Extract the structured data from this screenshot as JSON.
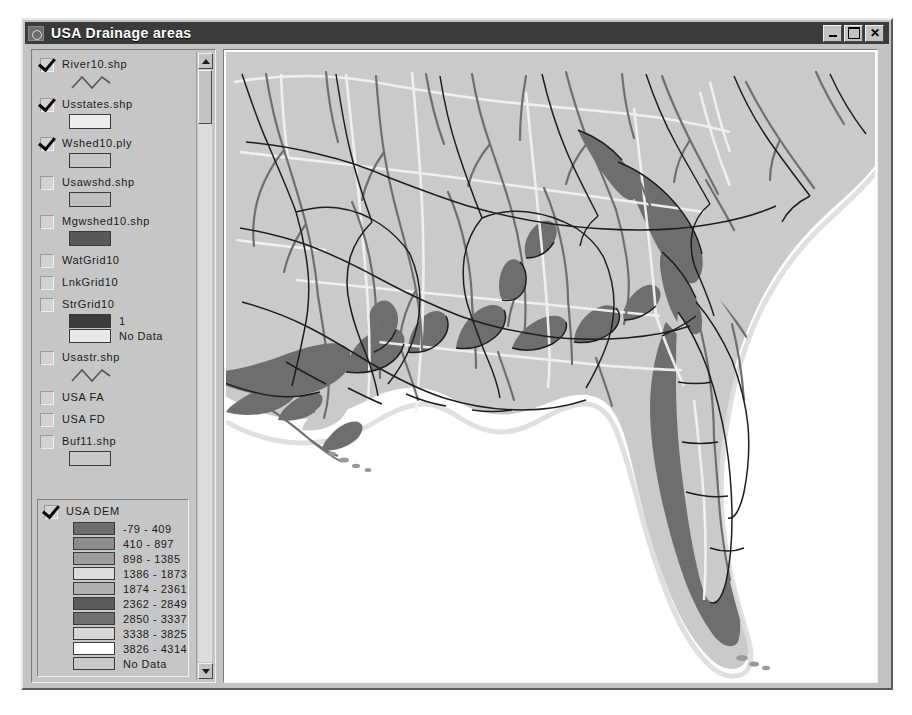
{
  "window": {
    "title": "USA Drainage areas",
    "icon": "app-icon",
    "buttons": {
      "minimize": "_",
      "maximize": "□",
      "close": "✕"
    }
  },
  "toc": {
    "layers": [
      {
        "name": "River10.shp",
        "checked": true,
        "symbol": "line"
      },
      {
        "name": "Usstates.shp",
        "checked": true,
        "symbol": "poly",
        "fill": "#ececec"
      },
      {
        "name": "Wshed10.ply",
        "checked": true,
        "symbol": "poly",
        "fill": "#c6c6c6"
      },
      {
        "name": "Usawshd.shp",
        "checked": false,
        "symbol": "poly",
        "fill": "#c0c0c0"
      },
      {
        "name": "Mgwshed10.shp",
        "checked": false,
        "symbol": "poly",
        "fill": "#585858"
      },
      {
        "name": "WatGrid10",
        "checked": false,
        "symbol": "none"
      },
      {
        "name": "LnkGrid10",
        "checked": false,
        "symbol": "none"
      },
      {
        "name": "StrGrid10",
        "checked": false,
        "symbol": "classes",
        "classes": [
          {
            "label": "1",
            "color": "#3c3c3c"
          },
          {
            "label": "No Data",
            "color": "#e8e8e8"
          }
        ]
      },
      {
        "name": "Usastr.shp",
        "checked": false,
        "symbol": "line"
      },
      {
        "name": "USA FA",
        "checked": false,
        "symbol": "none"
      },
      {
        "name": "USA FD",
        "checked": false,
        "symbol": "none"
      },
      {
        "name": "Buf11.shp",
        "checked": false,
        "symbol": "poly",
        "fill": "#c8c8c8"
      }
    ],
    "scrollbar": {
      "up_arrow": "scroll-up",
      "down_arrow": "scroll-down"
    }
  },
  "dem_legend": {
    "name": "USA DEM",
    "checked": true,
    "classes": [
      {
        "label": "-79 - 409",
        "color": "#6e6e6e"
      },
      {
        "label": "410 - 897",
        "color": "#8c8c8c"
      },
      {
        "label": "898 - 1385",
        "color": "#9d9d9d"
      },
      {
        "label": "1386 - 1873",
        "color": "#dcdcdc"
      },
      {
        "label": "1874 - 2361",
        "color": "#b0b0b0"
      },
      {
        "label": "2362 - 2849",
        "color": "#5c5c5c"
      },
      {
        "label": "2850 - 3337",
        "color": "#6f6f6f"
      },
      {
        "label": "3338 - 3825",
        "color": "#d6d6d6"
      },
      {
        "label": "3826 - 4314",
        "color": "#ffffff"
      },
      {
        "label": "No Data",
        "color": "#c9c9c9"
      }
    ]
  },
  "map": {
    "colors": {
      "ocean": "#ffffff",
      "land_light": "#cacaca",
      "land_dark": "#6e6e6e",
      "watershed_line": "#1e1e1e",
      "river": "#707070",
      "state_line": "#f2f2f2",
      "coast_halo": "#e2e2e2"
    }
  }
}
